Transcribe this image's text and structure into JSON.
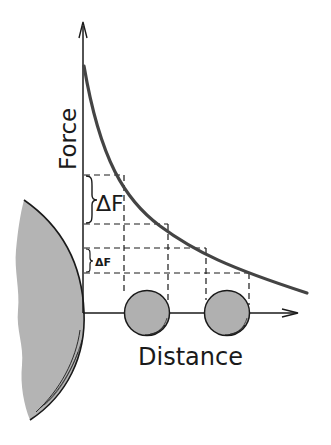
{
  "diagram": {
    "y_axis_label": "Force",
    "x_axis_label": "Distance",
    "delta_large": "ΔF",
    "delta_small": "ΔF",
    "colors": {
      "ink": "#1a1a1a",
      "curve": "#444444",
      "body_fill": "#b4b4b4",
      "ball_fill": "#b0b0b0",
      "background": "#ffffff"
    }
  }
}
